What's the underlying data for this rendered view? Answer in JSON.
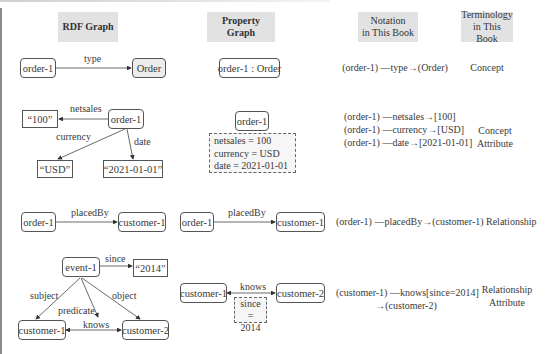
{
  "headers": {
    "rdf": "RDF Graph",
    "property": "Property Graph",
    "notation_line1": "Notation",
    "notation_line2": "in This Book",
    "terminology_line1": "Terminology",
    "terminology_line2": "in This Book"
  },
  "rows": {
    "concept": {
      "rdf": {
        "subject": "order-1",
        "edge": "type",
        "object": "Order"
      },
      "property": {
        "node": "order-1 : Order"
      },
      "notation": "(order-1) —type→(Order)",
      "term": "Concept"
    },
    "concept_attribute": {
      "rdf": {
        "subject": "order-1",
        "edges": {
          "netsales": "netsales",
          "currency": "currency",
          "date": "date"
        },
        "literals": {
          "netsales": "“100”",
          "currency": "“USD”",
          "date": "“2021-01-01”"
        }
      },
      "property": {
        "node": "order-1",
        "props": [
          "netsales = 100",
          "currency = USD",
          "date = 2021-01-01"
        ]
      },
      "notation": [
        "(order-1) —netsales→[100]",
        "(order-1) —currency→[USD]",
        "(order-1) —date→[2021-01-01]"
      ],
      "term_line1": "Concept",
      "term_line2": "Attribute"
    },
    "relationship": {
      "rdf": {
        "subject": "order-1",
        "edge": "placedBy",
        "object": "customer-1"
      },
      "property": {
        "subject": "order-1",
        "edge": "placedBy",
        "object": "customer-1"
      },
      "notation": "(order-1) —placedBy→(customer-1)",
      "term": "Relationship"
    },
    "relationship_attribute": {
      "rdf": {
        "event": "event-1",
        "since_edge": "since",
        "since_literal": "“2014”",
        "subject_edge": "subject",
        "predicate_edge": "predicate",
        "object_edge": "object",
        "knows_edge": "knows",
        "customer1": "customer-1",
        "customer2": "customer-2"
      },
      "property": {
        "customer1": "customer-1",
        "customer2": "customer-2",
        "edge": "knows",
        "prop_line1": "since =",
        "prop_line2": "2014"
      },
      "notation_line1": "(customer-1) —knows[since=2014]",
      "notation_line2": "→(customer-2)",
      "term_line1": "Relationship",
      "term_line2": "Attribute"
    }
  },
  "colors": {
    "header_bg": "#e2e2e2",
    "node_border": "#555555",
    "shaded_node": "#ececec",
    "text": "#3a3a3a"
  }
}
